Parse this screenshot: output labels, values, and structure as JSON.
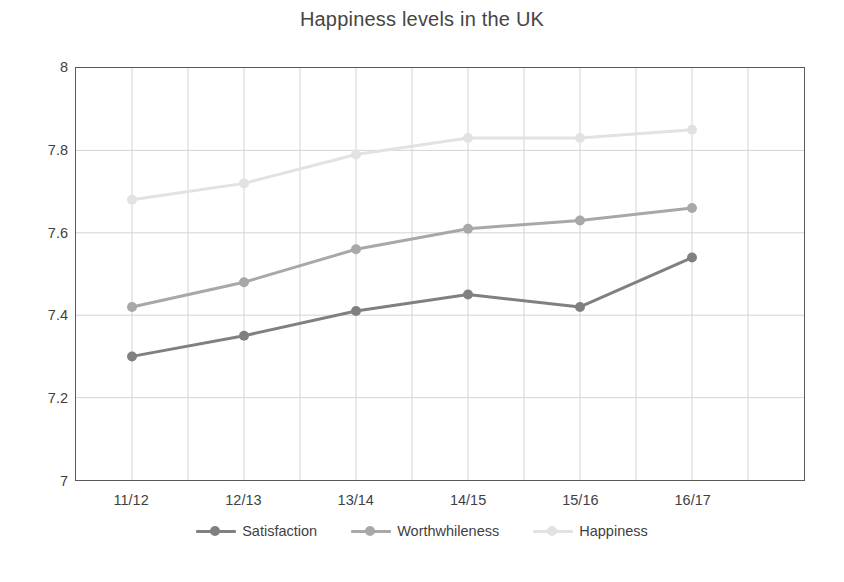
{
  "chart_data": {
    "type": "line",
    "title": "Happiness levels in the UK",
    "xlabel": "",
    "ylabel": "",
    "categories": [
      "11/12",
      "12/13",
      "13/14",
      "14/15",
      "15/16",
      "16/17"
    ],
    "series": [
      {
        "name": "Satisfaction",
        "color": "#808080",
        "values": [
          7.3,
          7.35,
          7.41,
          7.45,
          7.42,
          7.54
        ]
      },
      {
        "name": "Worthwhileness",
        "color": "#a8a8a8",
        "values": [
          7.42,
          7.48,
          7.56,
          7.61,
          7.63,
          7.66
        ]
      },
      {
        "name": "Happiness",
        "color": "#e2e2e2",
        "values": [
          7.68,
          7.72,
          7.79,
          7.83,
          7.83,
          7.85
        ]
      }
    ],
    "ylim": [
      7,
      8
    ],
    "yticks": [
      7,
      7.2,
      7.4,
      7.6,
      7.8,
      8
    ],
    "ytick_labels": [
      "7",
      "7.2",
      "7.4",
      "7.6",
      "7.8",
      "8"
    ],
    "grid": true,
    "grid_color": "#d4d4d4",
    "axis_color": "#5a5a5a",
    "legend_position": "bottom",
    "x_minor_gridlines": 13
  }
}
